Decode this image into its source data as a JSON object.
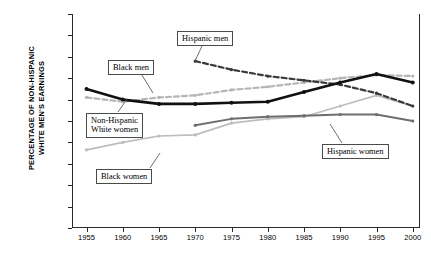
{
  "chart_data": {
    "type": "line",
    "title": "",
    "xlabel": "",
    "ylabel": "PERCENTAGE OF NON-HISPANIC WHITE MEN'S EARNINGS",
    "ylabel_line1": "PERCENTAGE OF NON-HISPANIC",
    "ylabel_line2": "WHITE MEN'S EARNINGS",
    "x": [
      1955,
      1960,
      1965,
      1970,
      1975,
      1980,
      1985,
      1990,
      1995,
      2000
    ],
    "xlim": [
      1953,
      2001
    ],
    "ylim": [
      0,
      100
    ],
    "xtick_labels": [
      "1955",
      "1960",
      "1965",
      "1970",
      "1975",
      "1980",
      "1985",
      "1990",
      "1995",
      "2000"
    ],
    "ytick_labels": [
      "0%",
      "10%",
      "20%",
      "30%",
      "40%",
      "50%",
      "60%",
      "70%",
      "80%",
      "90%",
      "100%"
    ],
    "ytick_values": [
      0,
      10,
      20,
      30,
      40,
      50,
      60,
      70,
      80,
      90,
      100
    ],
    "grid": false,
    "legend_position": "inline-callouts",
    "series": [
      {
        "name": "Non-Hispanic White women",
        "style": "solid",
        "color": "#111111",
        "width": 2.6,
        "x": [
          1955,
          1960,
          1965,
          1970,
          1975,
          1980,
          1985,
          1990,
          1995,
          2000
        ],
        "values": [
          65,
          60,
          58,
          58,
          58.5,
          59,
          63.5,
          68,
          72,
          68
        ]
      },
      {
        "name": "Black men",
        "style": "dashed",
        "color": "#b6b6b6",
        "width": 2.2,
        "x": [
          1955,
          1960,
          1965,
          1970,
          1975,
          1980,
          1985,
          1990,
          1995,
          2000
        ],
        "values": [
          61,
          59,
          61,
          62,
          64.5,
          66,
          68,
          70,
          71.5,
          71
        ]
      },
      {
        "name": "Black women",
        "style": "solid",
        "color": "#bdbdbd",
        "width": 1.7,
        "x": [
          1955,
          1960,
          1965,
          1970,
          1975,
          1980,
          1985,
          1990,
          1995,
          2000
        ],
        "values": [
          36.5,
          40,
          43,
          43.5,
          49,
          51,
          52,
          57,
          62,
          57
        ]
      },
      {
        "name": "Hispanic men",
        "style": "dashed",
        "color": "#3a3a3a",
        "width": 2.2,
        "x": [
          1970,
          1975,
          1980,
          1985,
          1990,
          1995,
          2000
        ],
        "values": [
          78,
          74,
          71,
          69,
          67,
          63,
          57
        ]
      },
      {
        "name": "Hispanic women",
        "style": "solid",
        "color": "#6e6e6e",
        "width": 2.0,
        "x": [
          1970,
          1975,
          1980,
          1985,
          1990,
          1995,
          2000
        ],
        "values": [
          48,
          51,
          52,
          52.5,
          53,
          53,
          50
        ]
      }
    ],
    "annotations": [
      {
        "id": "black-men",
        "text": "Black men"
      },
      {
        "id": "hispanic-men",
        "text": "Hispanic men"
      },
      {
        "id": "nh-white-women",
        "text": "Non-Hispanic\nWhite women"
      },
      {
        "id": "black-women",
        "text": "Black women"
      },
      {
        "id": "hispanic-women",
        "text": "Hispanic women"
      }
    ]
  }
}
